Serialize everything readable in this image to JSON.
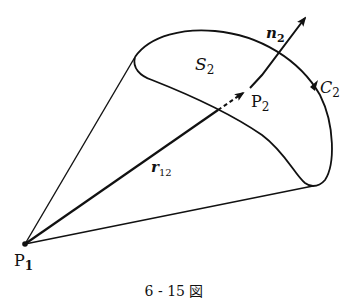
{
  "diagram": {
    "type": "vector-geometry",
    "labels": {
      "surface": {
        "main": "S",
        "sub": "2"
      },
      "curve": {
        "main": "C",
        "sub": "2"
      },
      "point_on_surface": {
        "main": "P",
        "sub": "2"
      },
      "normal": {
        "main": "n",
        "sub": "2"
      },
      "vector": {
        "main": "r",
        "sub": "12"
      },
      "origin_point": {
        "main": "P",
        "sub": "1"
      }
    },
    "caption": "6 - 15 図",
    "colors": {
      "stroke": "#111111",
      "background": "#ffffff"
    }
  }
}
